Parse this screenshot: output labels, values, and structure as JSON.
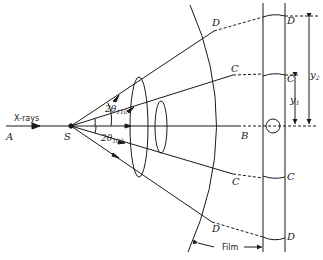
{
  "diagram": {
    "labels": {
      "xrays": "X-rays",
      "A": "A",
      "S": "S",
      "B": "B",
      "C_upper_arc": "C",
      "D_upper_arc": "D",
      "C_lower_arc": "C",
      "D_lower_arc": "D",
      "C_upper_film": "C",
      "D_upper_film": "D",
      "C_lower_film": "C",
      "D_lower_film": "D",
      "theta110_prefix": "2θ",
      "theta110_sub": "110",
      "theta100_prefix": "2θ",
      "theta100_sub": "100",
      "y1": "y",
      "y1_sub": "1",
      "y2": "y",
      "y2_sub": "2",
      "film": "Film"
    },
    "colors": {
      "ink": "#1a1a1a",
      "background": "#ffffff"
    }
  }
}
